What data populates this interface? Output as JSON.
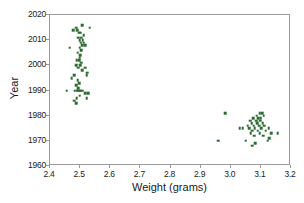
{
  "chart_data": {
    "type": "scatter",
    "title": "",
    "xlabel": "Weight (grams)",
    "ylabel": "Year",
    "xlim": [
      2.4,
      3.2
    ],
    "ylim": [
      1960,
      2020
    ],
    "xticks": [
      "2.4",
      "2.5",
      "2.6",
      "2.7",
      "2.8",
      "2.9",
      "3.0",
      "3.1",
      "3.2"
    ],
    "xtick_values": [
      2.4,
      2.5,
      2.6,
      2.7,
      2.8,
      2.9,
      3.0,
      3.1,
      3.2
    ],
    "yticks": [
      "1960",
      "1970",
      "1980",
      "1990",
      "2000",
      "2010",
      "2020"
    ],
    "ytick_values": [
      1960,
      1970,
      1980,
      1990,
      2000,
      2010,
      2020
    ],
    "grid": false,
    "legend": null,
    "marker_color": "#2d6b33",
    "marker_size": 2.6,
    "frame_color": "#9a9a9a",
    "background_color": "#ffffff",
    "series": [
      {
        "name": "coins",
        "points": [
          [
            2.532,
            2015
          ],
          [
            2.506,
            2016
          ],
          [
            2.486,
            2015
          ],
          [
            2.49,
            2014
          ],
          [
            2.478,
            2014
          ],
          [
            2.496,
            2013
          ],
          [
            2.5,
            2013
          ],
          [
            2.512,
            2012
          ],
          [
            2.494,
            2011
          ],
          [
            2.504,
            2011
          ],
          [
            2.498,
            2010
          ],
          [
            2.508,
            2010
          ],
          [
            2.502,
            2009
          ],
          [
            2.512,
            2009
          ],
          [
            2.506,
            2008
          ],
          [
            2.516,
            2008
          ],
          [
            2.466,
            2007
          ],
          [
            2.498,
            2007
          ],
          [
            2.504,
            2006
          ],
          [
            2.492,
            2005
          ],
          [
            2.5,
            2004
          ],
          [
            2.498,
            2003
          ],
          [
            2.488,
            2002
          ],
          [
            2.496,
            2002
          ],
          [
            2.504,
            2001
          ],
          [
            2.486,
            2000
          ],
          [
            2.5,
            2000
          ],
          [
            2.494,
            1999
          ],
          [
            2.516,
            1999
          ],
          [
            2.506,
            1998
          ],
          [
            2.524,
            1997
          ],
          [
            2.48,
            1996
          ],
          [
            2.522,
            1996
          ],
          [
            2.472,
            1995
          ],
          [
            2.492,
            1994
          ],
          [
            2.496,
            1993
          ],
          [
            2.486,
            1992
          ],
          [
            2.494,
            1991
          ],
          [
            2.456,
            1990
          ],
          [
            2.482,
            1990
          ],
          [
            2.488,
            1990
          ],
          [
            2.492,
            1990
          ],
          [
            2.496,
            1990
          ],
          [
            2.5,
            1990
          ],
          [
            2.506,
            1990
          ],
          [
            2.516,
            1989
          ],
          [
            2.526,
            1989
          ],
          [
            2.498,
            1988
          ],
          [
            2.488,
            1987
          ],
          [
            2.522,
            1987
          ],
          [
            2.48,
            1986
          ],
          [
            2.486,
            1985
          ]
        ]
      },
      {
        "name": "coins_pre_1982",
        "points": [
          [
            2.982,
            1981
          ],
          [
            3.096,
            1981
          ],
          [
            3.104,
            1981
          ],
          [
            3.086,
            1980
          ],
          [
            3.11,
            1980
          ],
          [
            3.074,
            1979
          ],
          [
            3.092,
            1979
          ],
          [
            3.1,
            1979
          ],
          [
            3.064,
            1978
          ],
          [
            3.084,
            1978
          ],
          [
            3.098,
            1978
          ],
          [
            3.07,
            1977
          ],
          [
            3.088,
            1977
          ],
          [
            3.106,
            1977
          ],
          [
            3.056,
            1976
          ],
          [
            3.076,
            1976
          ],
          [
            3.094,
            1976
          ],
          [
            3.112,
            1976
          ],
          [
            3.04,
            1975
          ],
          [
            3.062,
            1975
          ],
          [
            3.08,
            1975
          ],
          [
            3.102,
            1975
          ],
          [
            3.126,
            1975
          ],
          [
            3.03,
            1975
          ],
          [
            3.072,
            1974
          ],
          [
            3.09,
            1974
          ],
          [
            3.116,
            1974
          ],
          [
            3.066,
            1973
          ],
          [
            3.096,
            1973
          ],
          [
            3.134,
            1973
          ],
          [
            3.156,
            1973
          ],
          [
            3.078,
            1972
          ],
          [
            3.108,
            1972
          ],
          [
            3.128,
            1971
          ],
          [
            2.958,
            1970
          ],
          [
            3.05,
            1970
          ],
          [
            3.122,
            1970
          ],
          [
            3.082,
            1969
          ],
          [
            3.072,
            1968
          ]
        ]
      }
    ]
  }
}
